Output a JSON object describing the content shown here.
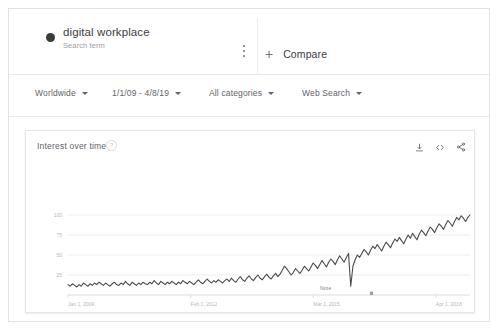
{
  "term": {
    "name": "digital workplace",
    "subtitle": "Search term",
    "dot_color": "#3b3b3b",
    "menu_icon": "more-vert-icon"
  },
  "compare": {
    "plus": "+",
    "label": "Compare"
  },
  "filters": [
    {
      "id": "region",
      "label": "Worldwide",
      "icon": "chevron-down-icon"
    },
    {
      "id": "date",
      "label": "1/1/09 - 4/8/19",
      "icon": "chevron-down-icon"
    },
    {
      "id": "category",
      "label": "All categories",
      "icon": "chevron-down-icon"
    },
    {
      "id": "search",
      "label": "Web Search",
      "icon": "chevron-down-icon"
    }
  ],
  "card": {
    "title": "Interest over time",
    "help_icon": "help-circle-icon",
    "help_glyph": "?",
    "actions": [
      {
        "id": "download",
        "icon": "download-icon"
      },
      {
        "id": "embed",
        "icon": "embed-code-icon"
      },
      {
        "id": "share",
        "icon": "share-icon"
      }
    ]
  },
  "chart_data": {
    "type": "line",
    "title": "Interest over time",
    "xlabel": "",
    "ylabel": "",
    "ylim": [
      0,
      100
    ],
    "yticks": [
      25,
      50,
      75,
      100
    ],
    "ytick_labels": [
      "25",
      "50",
      "75",
      "100"
    ],
    "grid": true,
    "legend": false,
    "line_color": "#4a4a4a",
    "xtick_labels": [
      "Jan 1, 2009",
      "Feb 1, 2012",
      "Mar 1, 2015",
      "Apr 1, 2018"
    ],
    "xtick_positions": [
      0,
      0.305,
      0.61,
      0.915
    ],
    "annotations": [
      {
        "label": "Note",
        "x": 0.755,
        "marker": true
      }
    ],
    "x_start": "2009-01-01",
    "x_end": "2019-04-08",
    "series": [
      {
        "name": "digital workplace",
        "values": [
          13,
          11,
          14,
          12,
          10,
          13,
          11,
          15,
          13,
          11,
          14,
          12,
          15,
          13,
          16,
          14,
          12,
          15,
          13,
          11,
          14,
          16,
          13,
          12,
          15,
          13,
          17,
          14,
          12,
          16,
          14,
          12,
          15,
          13,
          16,
          14,
          13,
          16,
          14,
          18,
          15,
          13,
          17,
          15,
          13,
          16,
          14,
          17,
          15,
          13,
          16,
          14,
          18,
          16,
          14,
          17,
          15,
          13,
          16,
          19,
          16,
          14,
          17,
          20,
          17,
          15,
          18,
          16,
          19,
          17,
          15,
          18,
          20,
          17,
          21,
          18,
          16,
          20,
          23,
          19,
          17,
          21,
          24,
          20,
          18,
          22,
          25,
          21,
          19,
          23,
          26,
          22,
          20,
          24,
          27,
          23,
          26,
          31,
          36,
          33,
          29,
          25,
          28,
          33,
          30,
          27,
          31,
          36,
          33,
          30,
          35,
          40,
          37,
          33,
          38,
          43,
          39,
          35,
          41,
          45,
          42,
          38,
          44,
          49,
          45,
          41,
          47,
          52,
          11,
          36,
          44,
          50,
          47,
          52,
          57,
          54,
          50,
          56,
          61,
          58,
          63,
          59,
          55,
          61,
          66,
          63,
          59,
          65,
          70,
          67,
          72,
          68,
          64,
          70,
          75,
          71,
          77,
          73,
          69,
          76,
          81,
          78,
          74,
          80,
          85,
          82,
          78,
          84,
          89,
          86,
          82,
          88,
          93,
          90,
          86,
          92,
          97,
          94,
          99,
          96,
          92,
          97,
          100
        ]
      }
    ]
  }
}
